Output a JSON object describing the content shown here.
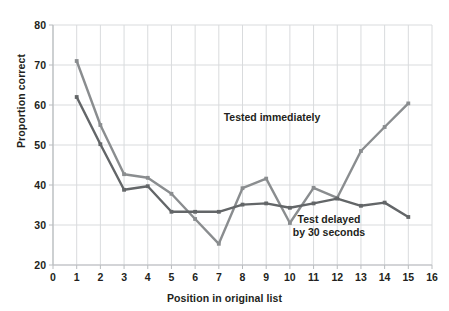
{
  "chart_data": {
    "type": "line",
    "title": "",
    "xlabel": "Position in original list",
    "ylabel": "Proportion correct",
    "xlim": [
      0,
      16
    ],
    "ylim": [
      20,
      80
    ],
    "xticks": [
      0,
      1,
      2,
      3,
      4,
      5,
      6,
      7,
      8,
      9,
      10,
      11,
      12,
      13,
      14,
      15,
      16
    ],
    "yticks": [
      20,
      30,
      40,
      50,
      60,
      70,
      80
    ],
    "grid": true,
    "legend_position": "inline-annotations",
    "x": [
      1,
      2,
      3,
      4,
      5,
      6,
      7,
      8,
      9,
      10,
      11,
      12,
      13,
      14,
      15
    ],
    "series": [
      {
        "name": "Tested immediately",
        "color": "#8a8d8f",
        "values": [
          71.0,
          55.0,
          42.7,
          41.8,
          37.8,
          31.5,
          25.3,
          39.2,
          41.6,
          30.5,
          39.3,
          36.8,
          48.5,
          54.5,
          60.4
        ]
      },
      {
        "name": "Test delayed by 30 seconds",
        "color": "#636668",
        "values": [
          62.0,
          50.2,
          38.8,
          39.7,
          33.3,
          33.3,
          33.3,
          35.1,
          35.4,
          34.3,
          35.4,
          36.6,
          34.8,
          35.6,
          32.0
        ]
      }
    ],
    "annotations": [
      {
        "name": "tested-immediately-label",
        "text": "Tested immediately",
        "lines": [
          "Tested immediately"
        ],
        "x_px": 272,
        "y_px": 121
      },
      {
        "name": "test-delayed-label",
        "text": "Test delayed by 30 seconds",
        "lines": [
          "Test delayed",
          "by 30 seconds"
        ],
        "x_px": 329,
        "y_px": 223
      }
    ]
  },
  "axes": {
    "y_title": "Proportion correct",
    "x_title": "Position in original list",
    "y_tick_labels": [
      "20",
      "30",
      "40",
      "50",
      "60",
      "70",
      "80"
    ],
    "x_tick_labels": [
      "0",
      "1",
      "2",
      "3",
      "4",
      "5",
      "6",
      "7",
      "8",
      "9",
      "10",
      "11",
      "12",
      "13",
      "14",
      "15",
      "16"
    ]
  },
  "colors": {
    "background": "#ffffff",
    "grid": "#d9dbdd",
    "axis": "#b9bcbf",
    "text": "#231f20",
    "series_light": "#8a8d8f",
    "series_dark": "#636668"
  }
}
